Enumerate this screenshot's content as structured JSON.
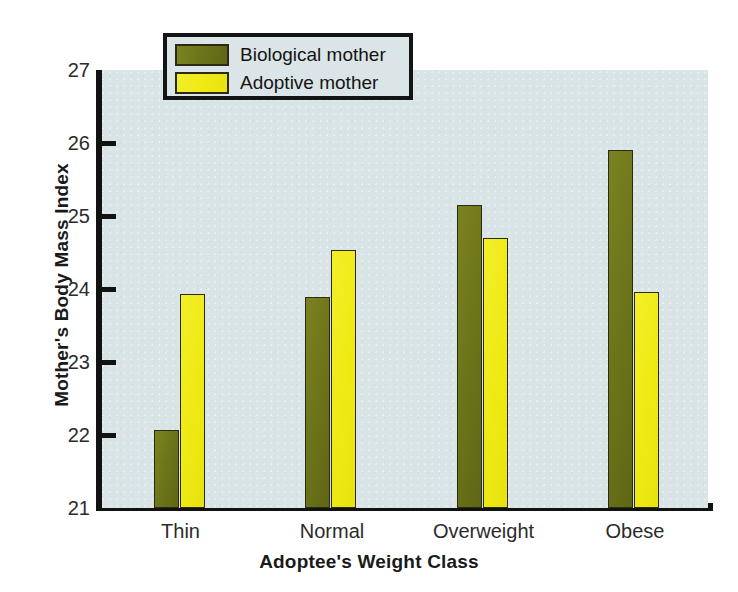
{
  "chart_data": {
    "type": "bar",
    "title": "",
    "xlabel": "Adoptee's Weight Class",
    "ylabel": "Mother's Body Mass Index",
    "categories": [
      "Thin",
      "Normal",
      "Overweight",
      "Obese"
    ],
    "series": [
      {
        "name": "Biological mother",
        "color": "#6b7319",
        "values": [
          22.07,
          23.89,
          25.15,
          25.9
        ]
      },
      {
        "name": "Adoptive mother",
        "color": "#efe913",
        "values": [
          23.93,
          24.54,
          24.7,
          23.96
        ]
      }
    ],
    "ylim": [
      21,
      27
    ],
    "yticks": [
      21,
      22,
      23,
      24,
      25,
      26,
      27
    ],
    "ytick_labels": [
      "21",
      "22",
      "23",
      "24",
      "25",
      "26",
      "27"
    ],
    "grid": false,
    "legend_position": "top-left-inside",
    "plot_background": "#d9e4e6",
    "page_background": "#ffffff"
  },
  "legend": {
    "entries": [
      {
        "label": "Biological mother",
        "swatch": "bio"
      },
      {
        "label": "Adoptive mother",
        "swatch": "ado"
      }
    ]
  }
}
